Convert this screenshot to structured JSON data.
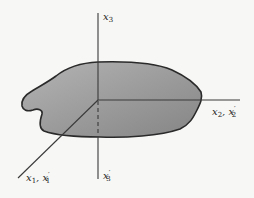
{
  "figure": {
    "type": "coordinate-axes-with-body",
    "background_color": "#f7f7f5",
    "body_fill_color": "#9a9a9a",
    "body_outline_color": "#2a2a2a",
    "axis_color": "#3a3a3a"
  },
  "labels": {
    "x3": {
      "base": "x",
      "sub": "3",
      "prime": ""
    },
    "x3_prime": {
      "base": "x",
      "sub": "3",
      "prime": "′"
    },
    "x2": {
      "base": "x",
      "sub": "2",
      "sep": ", ",
      "base2": "x",
      "sub2": "2",
      "prime2": "′"
    },
    "x1": {
      "base": "x",
      "sub": "1",
      "sep": ", ",
      "base2": "x",
      "sub2": "1",
      "prime2": "′"
    }
  }
}
